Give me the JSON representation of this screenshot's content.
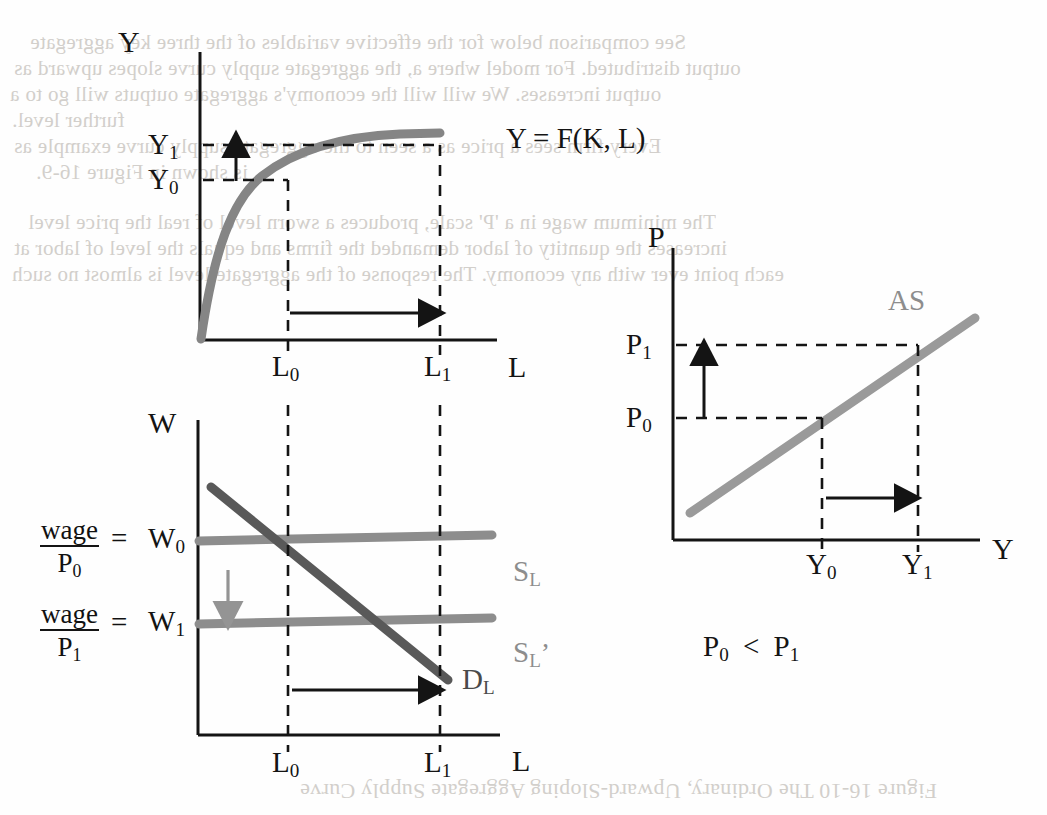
{
  "figure": {
    "caption_showthrough": "Figure 16-10   The Ordinary, Upward-Sloping Aggregate Supply Curve",
    "background_showthrough": [
      "See comparison below for the effective variables of the three key aggregate",
      "output distributed. For model where a, the aggregate supply curve slopes upward as",
      "output increases. We will will the economy's aggregate outputs will go to a",
      "further level.",
      "Every firm sees a price as a seen to the aggregate supply curve example as",
      "is shown in Figure 16-9.",
      "The minimum wage in a 'P' scale, produces a sworn level of real the price level",
      "increases the quantity of labor demanded the firms and equals the level of labor at",
      "each point ever with any economy. The response of the aggregate level is almost no such"
    ]
  },
  "charts": [
    {
      "id": "production-function",
      "type": "line",
      "title": "",
      "xlabel": "L",
      "ylabel": "Y",
      "curve_label": "Y = F(K, L)",
      "xticks": [
        "L",
        "L"
      ],
      "xtick_subs": [
        "0",
        "1"
      ],
      "yticks": [
        "Y",
        "Y"
      ],
      "ytick_subs": [
        "1",
        "0"
      ],
      "points": [
        {
          "x": "L",
          "sub": "0",
          "y": "Y",
          "ysub": "0"
        },
        {
          "x": "L",
          "sub": "1",
          "y": "Y",
          "ysub": "1"
        }
      ],
      "shift_arrow_x": "rightward",
      "shift_arrow_y": "upward",
      "curve_color": "#858585"
    },
    {
      "id": "labor-market",
      "type": "line",
      "title": "",
      "xlabel": "L",
      "ylabel": "W",
      "curve_labels": [
        "S",
        "S",
        "D"
      ],
      "curve_label_subs": [
        "L",
        "L",
        "L"
      ],
      "supply_label_1": "S",
      "supply_label_1_sub": "L",
      "supply_label_2": "S",
      "supply_label_2_sub": "L",
      "supply_label_2_prime": "’",
      "demand_label": "D",
      "demand_label_sub": "L",
      "yticks": [
        "W",
        "W"
      ],
      "ytick_subs": [
        "0",
        "1"
      ],
      "xticks": [
        "L",
        "L"
      ],
      "xtick_subs": [
        "0",
        "1"
      ],
      "wage_ratio_1": {
        "num": "wage",
        "den": "P",
        "den_sub": "0",
        "eq": "=",
        "value": "W",
        "value_sub": "0"
      },
      "wage_ratio_2": {
        "num": "wage",
        "den": "P",
        "den_sub": "1",
        "eq": "=",
        "value": "W",
        "value_sub": "1"
      },
      "shift_arrow_supply": "downward",
      "shift_arrow_labor": "rightward",
      "supply_color": "#8d8d8d",
      "demand_color": "#595959"
    },
    {
      "id": "aggregate-supply",
      "type": "line",
      "title": "",
      "xlabel": "Y",
      "ylabel": "P",
      "curve_label": "AS",
      "yticks": [
        "P",
        "P"
      ],
      "ytick_subs": [
        "1",
        "0"
      ],
      "xticks": [
        "Y",
        "Y"
      ],
      "xtick_subs": [
        "0",
        "1"
      ],
      "shift_arrow_price": "upward",
      "shift_arrow_output": "rightward",
      "note": {
        "left": "P",
        "left_sub": "0",
        "op": "<",
        "right": "P",
        "right_sub": "1"
      },
      "curve_color": "#9a9a9a"
    }
  ]
}
